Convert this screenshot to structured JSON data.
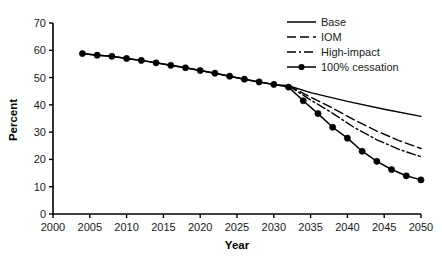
{
  "chart_data": {
    "type": "line",
    "title": "",
    "xlabel": "Year",
    "ylabel": "Percent",
    "xlim": [
      2000,
      2050
    ],
    "ylim": [
      0,
      70
    ],
    "xticks": [
      2000,
      2005,
      2010,
      2015,
      2020,
      2025,
      2030,
      2035,
      2040,
      2045,
      2050
    ],
    "yticks": [
      0,
      10,
      20,
      30,
      40,
      50,
      60,
      70
    ],
    "grid": false,
    "legend_position": "top-right",
    "x": [
      2004,
      2006,
      2008,
      2010,
      2012,
      2014,
      2016,
      2018,
      2020,
      2022,
      2024,
      2026,
      2028,
      2030,
      2032,
      2034,
      2036,
      2038,
      2040,
      2042,
      2044,
      2046,
      2048,
      2050
    ],
    "series": [
      {
        "name": "Base",
        "style": "solid",
        "markers": false,
        "x": [
          2004,
          2006,
          2008,
          2010,
          2012,
          2014,
          2016,
          2018,
          2020,
          2022,
          2024,
          2026,
          2028,
          2030,
          2032,
          2035,
          2040,
          2045,
          2050
        ],
        "values": [
          58.8,
          58.2,
          57.8,
          57.0,
          56.3,
          55.4,
          54.5,
          53.6,
          52.6,
          51.6,
          50.5,
          49.4,
          48.4,
          47.5,
          47.0,
          44.5,
          41.3,
          38.4,
          35.8
        ]
      },
      {
        "name": "IOM",
        "style": "dashed",
        "markers": false,
        "x": [
          2032,
          2035,
          2038,
          2041,
          2044,
          2047,
          2050
        ],
        "values": [
          47.0,
          42.8,
          38.8,
          34.4,
          30.4,
          26.9,
          24.0
        ]
      },
      {
        "name": "High-impact",
        "style": "dashdot",
        "markers": false,
        "x": [
          2032,
          2035,
          2038,
          2041,
          2044,
          2047,
          2050
        ],
        "values": [
          47.0,
          41.8,
          36.9,
          31.6,
          27.2,
          23.7,
          21.0
        ]
      },
      {
        "name": "100% cessation",
        "style": "solid",
        "markers": true,
        "x": [
          2004,
          2006,
          2008,
          2010,
          2012,
          2014,
          2016,
          2018,
          2020,
          2022,
          2024,
          2026,
          2028,
          2030,
          2032,
          2034,
          2036,
          2038,
          2040,
          2042,
          2044,
          2046,
          2048,
          2050
        ],
        "values": [
          58.8,
          58.2,
          57.8,
          57.0,
          56.3,
          55.4,
          54.5,
          53.6,
          52.6,
          51.6,
          50.5,
          49.4,
          48.4,
          47.5,
          46.5,
          41.5,
          36.8,
          31.8,
          27.8,
          23.0,
          19.3,
          16.3,
          14.0,
          12.5
        ]
      }
    ],
    "legend": [
      {
        "label": "Base",
        "style": "solid",
        "marker": false
      },
      {
        "label": "IOM",
        "style": "dashed",
        "marker": false
      },
      {
        "label": "High-impact",
        "style": "dashdot",
        "marker": false
      },
      {
        "label": "100% cessation",
        "style": "solid",
        "marker": true
      }
    ],
    "colors": {
      "line": "#000000",
      "axis": "#000000",
      "text": "#1a1a1a",
      "background": "#ffffff"
    }
  }
}
